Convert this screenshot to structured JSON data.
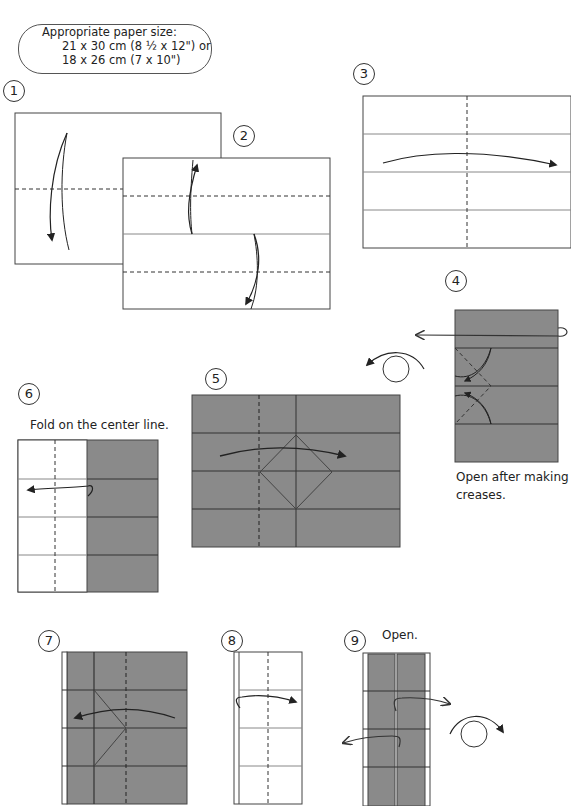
{
  "paper_size_note": {
    "title": "Appropriate paper size:",
    "line1": "21 x 30 cm (8 ½ x 12\") or",
    "line2": "18 x 26 cm (7 x 10\")"
  },
  "steps": [
    {
      "number": "1"
    },
    {
      "number": "2"
    },
    {
      "number": "3"
    },
    {
      "number": "4",
      "caption_line1": "Open after making",
      "caption_line2": "creases."
    },
    {
      "number": "5"
    },
    {
      "number": "6",
      "caption": "Fold on the center line."
    },
    {
      "number": "7"
    },
    {
      "number": "8"
    },
    {
      "number": "9",
      "caption": "Open."
    }
  ],
  "colors": {
    "paper_colored": "#8a8a8a",
    "paper_white": "#ffffff",
    "line": "#333333"
  }
}
